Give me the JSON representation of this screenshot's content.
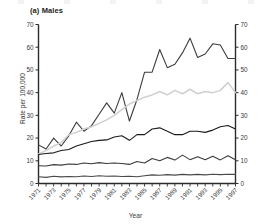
{
  "figure": {
    "panel_title": "(a) Males",
    "xlabel": "Year",
    "ylabel": "Rate per 100,000"
  },
  "axis": {
    "y_ticks": [
      "0",
      "10",
      "20",
      "30",
      "40",
      "50",
      "60",
      "70"
    ],
    "y_ticks_right": [
      "0",
      "10",
      "20",
      "30",
      "40",
      "50",
      "60",
      "70"
    ],
    "x_ticks": [
      "1971",
      "1973",
      "1975",
      "1977",
      "1979",
      "1981",
      "1983",
      "1985",
      "1987",
      "1989",
      "1991",
      "1993",
      "1995",
      "1997"
    ]
  },
  "colors": {
    "series_dark": "#3b3b3b",
    "series_black": "#1a1a1a",
    "series_gray": "#cfcfcf",
    "axis": "#2b2b2b",
    "text": "#3a3a3a"
  },
  "chart_data": {
    "type": "line",
    "title": "(a) Males",
    "xlabel": "Year",
    "ylabel": "Rate per 100,000",
    "xlim": [
      1971,
      1997
    ],
    "ylim": [
      0,
      70
    ],
    "grid": false,
    "legend": "none",
    "x": [
      1971,
      1972,
      1973,
      1974,
      1975,
      1976,
      1977,
      1978,
      1979,
      1980,
      1981,
      1982,
      1983,
      1984,
      1985,
      1986,
      1987,
      1988,
      1989,
      1990,
      1991,
      1992,
      1993,
      1994,
      1995,
      1996,
      1997
    ],
    "series": [
      {
        "name": "series-1-top",
        "color": "#3b3b3b",
        "values": [
          17.0,
          15.2,
          20.0,
          16.5,
          21.0,
          27.0,
          23.0,
          25.5,
          30.5,
          35.5,
          31.0,
          40.0,
          27.5,
          37.0,
          49.0,
          49.0,
          59.0,
          51.0,
          52.5,
          57.5,
          64.0,
          55.5,
          57.0,
          61.5,
          61.0,
          55.0,
          55.0
        ]
      },
      {
        "name": "series-2-gray",
        "color": "#cfcfcf",
        "values": [
          13.0,
          14.5,
          16.5,
          18.0,
          21.5,
          22.5,
          24.0,
          25.0,
          26.5,
          28.0,
          30.0,
          32.5,
          35.0,
          36.5,
          38.0,
          39.0,
          40.5,
          39.0,
          41.0,
          39.5,
          41.5,
          39.5,
          40.5,
          40.0,
          41.0,
          44.5,
          40.0
        ]
      },
      {
        "name": "series-3-middle",
        "color": "#1a1a1a",
        "values": [
          12.8,
          13.2,
          13.5,
          14.5,
          15.0,
          16.5,
          17.5,
          18.5,
          19.0,
          19.2,
          20.5,
          21.0,
          19.0,
          21.5,
          21.5,
          24.0,
          24.5,
          23.0,
          21.5,
          21.5,
          23.0,
          23.0,
          22.5,
          23.5,
          25.0,
          25.5,
          24.0
        ]
      },
      {
        "name": "series-4-lower",
        "color": "#3b3b3b",
        "values": [
          7.8,
          7.7,
          8.3,
          8.1,
          8.6,
          8.4,
          9.0,
          8.7,
          9.2,
          8.8,
          9.0,
          8.8,
          8.4,
          9.7,
          9.0,
          11.0,
          10.0,
          11.5,
          10.3,
          12.5,
          10.5,
          11.8,
          10.5,
          12.0,
          10.4,
          12.2,
          10.5
        ]
      },
      {
        "name": "series-5-bottom",
        "color": "#4a4a4a",
        "values": [
          3.0,
          2.7,
          3.2,
          2.9,
          3.1,
          3.0,
          3.3,
          3.1,
          3.4,
          3.2,
          3.3,
          3.1,
          3.2,
          3.0,
          3.4,
          3.8,
          3.6,
          3.9,
          3.7,
          4.0,
          3.8,
          4.0,
          3.8,
          4.1,
          3.9,
          4.1,
          4.0
        ]
      }
    ]
  }
}
